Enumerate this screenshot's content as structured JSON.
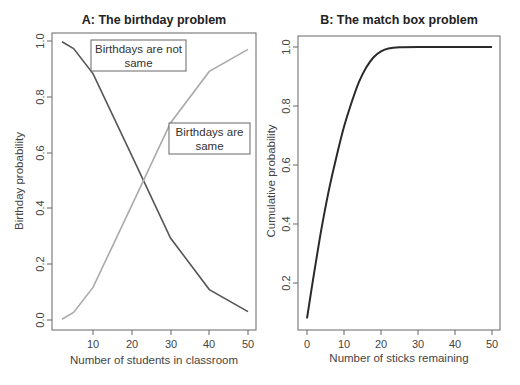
{
  "chart_data": [
    {
      "type": "line",
      "title": "A: The birthday problem",
      "xlabel": "Number of students in classroom",
      "ylabel": "Birthday probability",
      "x_ticks": [
        "10",
        "20",
        "30",
        "40",
        "50"
      ],
      "y_ticks": [
        "0.0",
        "0.2",
        "0.4",
        "0.6",
        "0.8",
        "1.0"
      ],
      "xlim": [
        0,
        50
      ],
      "ylim": [
        0,
        1
      ],
      "grid": false,
      "x": [
        2,
        5,
        10,
        20,
        30,
        40,
        50
      ],
      "series": [
        {
          "name": "Birthdays are not same",
          "color": "#555555",
          "values": [
            0.997,
            0.973,
            0.883,
            0.589,
            0.294,
            0.109,
            0.03
          ]
        },
        {
          "name": "Birthdays are same",
          "color": "#aaaaaa",
          "values": [
            0.003,
            0.027,
            0.117,
            0.411,
            0.706,
            0.891,
            0.97
          ]
        }
      ],
      "annotations": [
        {
          "text": "Birthdays are not same",
          "near": "upper-left"
        },
        {
          "text": "Birthdays are same",
          "near": "right-middle"
        }
      ]
    },
    {
      "type": "line",
      "title": "B: The match box problem",
      "xlabel": "Number of sticks remaining",
      "ylabel": "Cumulative probability",
      "x_ticks": [
        "0",
        "10",
        "20",
        "30",
        "40",
        "50"
      ],
      "y_ticks": [
        "0.2",
        "0.4",
        "0.6",
        "0.8",
        "1.0"
      ],
      "xlim": [
        0,
        50
      ],
      "ylim": [
        0.07,
        1.0
      ],
      "grid": false,
      "x": [
        0,
        2,
        4,
        6,
        8,
        10,
        12,
        14,
        16,
        18,
        20,
        22,
        25,
        30,
        40,
        50
      ],
      "series": [
        {
          "name": "Cumulative probability",
          "color": "#222222",
          "values": [
            0.08,
            0.24,
            0.39,
            0.52,
            0.63,
            0.73,
            0.81,
            0.88,
            0.93,
            0.965,
            0.985,
            0.995,
            0.999,
            1.0,
            1.0,
            1.0
          ]
        }
      ]
    }
  ],
  "panelA": {
    "title": "A: The birthday problem",
    "xlabel": "Number of students in classroom",
    "ylabel": "Birthday probability",
    "xticks": [
      "10",
      "20",
      "30",
      "40",
      "50"
    ],
    "yticks": [
      "0.0",
      "0.2",
      "0.4",
      "0.6",
      "0.8",
      "1.0"
    ],
    "ann1_line1": "Birthdays are not",
    "ann1_line2": "same",
    "ann2_line1": "Birthdays are",
    "ann2_line2": "same"
  },
  "panelB": {
    "title": "B: The match box problem",
    "xlabel": "Number of sticks remaining",
    "ylabel": "Cumulative probability",
    "xticks": [
      "0",
      "10",
      "20",
      "30",
      "40",
      "50"
    ],
    "yticks": [
      "0.2",
      "0.4",
      "0.6",
      "0.8",
      "1.0"
    ]
  }
}
